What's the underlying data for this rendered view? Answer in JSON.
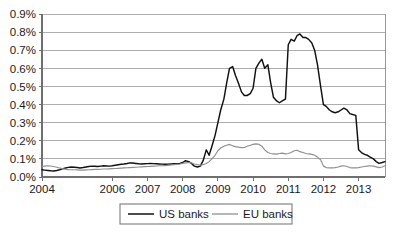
{
  "chart_data": {
    "type": "line",
    "title": "",
    "xlabel": "",
    "ylabel": "",
    "ylim": [
      0.0,
      0.9
    ],
    "xlim": [
      2004.0,
      2013.75
    ],
    "grid": true,
    "legend_position": "bottom-center",
    "y_ticks": [
      "0.0%",
      "0.1%",
      "0.2%",
      "0.3%",
      "0.4%",
      "0.5%",
      "0.6%",
      "0.7%",
      "0.8%",
      "0.9%"
    ],
    "y_tick_values": [
      0.0,
      0.1,
      0.2,
      0.3,
      0.4,
      0.5,
      0.6,
      0.7,
      0.8,
      0.9
    ],
    "x_ticks": [
      "2004",
      "2006",
      "2007",
      "2008",
      "2009",
      "2010",
      "2011",
      "2012",
      "2013"
    ],
    "x_tick_values": [
      2004,
      2006,
      2007,
      2008,
      2009,
      2010,
      2011,
      2012,
      2013
    ],
    "series": [
      {
        "name": "US banks",
        "color": "#111111",
        "x": [
          2004.0,
          2004.08,
          2004.17,
          2004.25,
          2004.33,
          2004.42,
          2004.5,
          2004.58,
          2004.67,
          2004.75,
          2004.83,
          2004.92,
          2005.0,
          2005.08,
          2005.17,
          2005.25,
          2005.33,
          2005.42,
          2005.5,
          2005.58,
          2005.67,
          2005.75,
          2005.83,
          2005.92,
          2006.0,
          2006.08,
          2006.17,
          2006.25,
          2006.33,
          2006.42,
          2006.5,
          2006.58,
          2006.67,
          2006.75,
          2006.83,
          2006.92,
          2007.0,
          2007.08,
          2007.17,
          2007.25,
          2007.33,
          2007.42,
          2007.5,
          2007.58,
          2007.67,
          2007.75,
          2007.83,
          2007.92,
          2008.0,
          2008.08,
          2008.17,
          2008.25,
          2008.33,
          2008.42,
          2008.5,
          2008.58,
          2008.67,
          2008.75,
          2008.83,
          2008.92,
          2009.0,
          2009.08,
          2009.17,
          2009.25,
          2009.33,
          2009.42,
          2009.5,
          2009.58,
          2009.67,
          2009.75,
          2009.83,
          2009.92,
          2010.0,
          2010.08,
          2010.17,
          2010.25,
          2010.33,
          2010.42,
          2010.5,
          2010.58,
          2010.67,
          2010.75,
          2010.83,
          2010.92,
          2011.0,
          2011.08,
          2011.17,
          2011.25,
          2011.33,
          2011.42,
          2011.5,
          2011.58,
          2011.67,
          2011.75,
          2011.83,
          2011.92,
          2012.0,
          2012.08,
          2012.17,
          2012.25,
          2012.33,
          2012.42,
          2012.5,
          2012.58,
          2012.67,
          2012.75,
          2012.83,
          2012.92,
          2013.0,
          2013.08,
          2013.17,
          2013.25,
          2013.33,
          2013.42,
          2013.5,
          2013.58,
          2013.67,
          2013.75
        ],
        "values": [
          0.04,
          0.038,
          0.036,
          0.034,
          0.033,
          0.036,
          0.04,
          0.045,
          0.05,
          0.053,
          0.055,
          0.054,
          0.052,
          0.05,
          0.052,
          0.055,
          0.058,
          0.06,
          0.059,
          0.058,
          0.06,
          0.062,
          0.061,
          0.06,
          0.062,
          0.065,
          0.068,
          0.07,
          0.072,
          0.075,
          0.078,
          0.077,
          0.075,
          0.073,
          0.072,
          0.073,
          0.074,
          0.075,
          0.074,
          0.073,
          0.072,
          0.071,
          0.07,
          0.071,
          0.072,
          0.073,
          0.074,
          0.075,
          0.08,
          0.09,
          0.085,
          0.075,
          0.06,
          0.055,
          0.06,
          0.09,
          0.15,
          0.12,
          0.17,
          0.23,
          0.3,
          0.37,
          0.43,
          0.52,
          0.6,
          0.61,
          0.56,
          0.52,
          0.47,
          0.45,
          0.45,
          0.46,
          0.49,
          0.6,
          0.63,
          0.65,
          0.6,
          0.62,
          0.52,
          0.44,
          0.42,
          0.41,
          0.42,
          0.43,
          0.73,
          0.76,
          0.75,
          0.78,
          0.79,
          0.77,
          0.77,
          0.76,
          0.74,
          0.7,
          0.62,
          0.5,
          0.4,
          0.39,
          0.37,
          0.36,
          0.355,
          0.36,
          0.37,
          0.38,
          0.37,
          0.35,
          0.345,
          0.34,
          0.15,
          0.135,
          0.125,
          0.12,
          0.11,
          0.1,
          0.085,
          0.075,
          0.08,
          0.085
        ]
      },
      {
        "name": "EU banks",
        "color": "#8e8e8e",
        "x": [
          2004.0,
          2004.08,
          2004.17,
          2004.25,
          2004.33,
          2004.42,
          2004.5,
          2004.58,
          2004.67,
          2004.75,
          2004.83,
          2004.92,
          2005.0,
          2005.08,
          2005.17,
          2005.25,
          2005.33,
          2005.42,
          2005.5,
          2005.58,
          2005.67,
          2005.75,
          2005.83,
          2005.92,
          2006.0,
          2006.08,
          2006.17,
          2006.25,
          2006.33,
          2006.42,
          2006.5,
          2006.58,
          2006.67,
          2006.75,
          2006.83,
          2006.92,
          2007.0,
          2007.08,
          2007.17,
          2007.25,
          2007.33,
          2007.42,
          2007.5,
          2007.58,
          2007.67,
          2007.75,
          2007.83,
          2007.92,
          2008.0,
          2008.08,
          2008.17,
          2008.25,
          2008.33,
          2008.42,
          2008.5,
          2008.58,
          2008.67,
          2008.75,
          2008.83,
          2008.92,
          2009.0,
          2009.08,
          2009.17,
          2009.25,
          2009.33,
          2009.42,
          2009.5,
          2009.58,
          2009.67,
          2009.75,
          2009.83,
          2009.92,
          2010.0,
          2010.08,
          2010.17,
          2010.25,
          2010.33,
          2010.42,
          2010.5,
          2010.58,
          2010.67,
          2010.75,
          2010.83,
          2010.92,
          2011.0,
          2011.08,
          2011.17,
          2011.25,
          2011.33,
          2011.42,
          2011.5,
          2011.58,
          2011.67,
          2011.75,
          2011.83,
          2011.92,
          2012.0,
          2012.08,
          2012.17,
          2012.25,
          2012.33,
          2012.42,
          2012.5,
          2012.58,
          2012.67,
          2012.75,
          2012.83,
          2012.92,
          2013.0,
          2013.08,
          2013.17,
          2013.25,
          2013.33,
          2013.42,
          2013.5,
          2013.58,
          2013.67,
          2013.75
        ],
        "values": [
          0.058,
          0.06,
          0.062,
          0.061,
          0.058,
          0.054,
          0.05,
          0.046,
          0.043,
          0.041,
          0.04,
          0.04,
          0.039,
          0.038,
          0.038,
          0.039,
          0.04,
          0.041,
          0.042,
          0.042,
          0.043,
          0.044,
          0.044,
          0.045,
          0.046,
          0.047,
          0.048,
          0.049,
          0.05,
          0.051,
          0.052,
          0.053,
          0.054,
          0.055,
          0.056,
          0.057,
          0.058,
          0.059,
          0.06,
          0.061,
          0.062,
          0.062,
          0.063,
          0.064,
          0.066,
          0.068,
          0.07,
          0.072,
          0.075,
          0.078,
          0.08,
          0.078,
          0.072,
          0.068,
          0.065,
          0.068,
          0.075,
          0.085,
          0.1,
          0.12,
          0.145,
          0.16,
          0.17,
          0.175,
          0.18,
          0.172,
          0.168,
          0.165,
          0.162,
          0.163,
          0.17,
          0.175,
          0.18,
          0.183,
          0.18,
          0.17,
          0.15,
          0.135,
          0.13,
          0.128,
          0.126,
          0.13,
          0.132,
          0.128,
          0.13,
          0.135,
          0.145,
          0.148,
          0.14,
          0.135,
          0.13,
          0.128,
          0.125,
          0.12,
          0.11,
          0.095,
          0.06,
          0.052,
          0.05,
          0.05,
          0.052,
          0.055,
          0.06,
          0.062,
          0.058,
          0.052,
          0.05,
          0.05,
          0.052,
          0.055,
          0.058,
          0.06,
          0.062,
          0.06,
          0.056,
          0.052,
          0.055,
          0.062
        ]
      }
    ],
    "legend": [
      {
        "label": "US banks",
        "color": "#111111"
      },
      {
        "label": "EU banks",
        "color": "#8e8e8e"
      }
    ]
  }
}
